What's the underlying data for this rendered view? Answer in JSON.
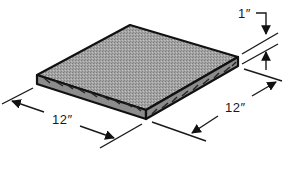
{
  "diagram": {
    "dimensions": {
      "thickness": {
        "label": "1″"
      },
      "length": {
        "label": "12″"
      },
      "width": {
        "label": "12″"
      }
    },
    "colors": {
      "face": "#9e9e9e",
      "edge": "#7a7a7a",
      "outline": "#111111",
      "line": "#1a1a1a"
    }
  }
}
